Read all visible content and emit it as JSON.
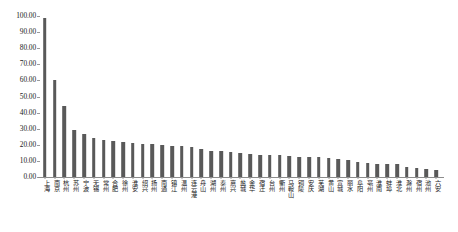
{
  "chart_data": {
    "type": "bar",
    "title": "",
    "subtitle": "",
    "xlabel": "",
    "ylabel": "",
    "ylim": [
      0,
      100
    ],
    "grid": false,
    "legend": "none",
    "bar_color": "#595959",
    "axis_color": "#8c8c8c",
    "y_ticks": [
      "0.00",
      "10.00",
      "20.00",
      "30.00",
      "40.00",
      "50.00",
      "60.00",
      "70.00",
      "80.00",
      "90.00",
      "100.00"
    ],
    "y_tick_values": [
      0,
      10,
      20,
      30,
      40,
      50,
      60,
      70,
      80,
      90,
      100
    ],
    "categories": [
      "上海",
      "南京",
      "杭州",
      "苏州",
      "宁波",
      "无锡",
      "常州",
      "合肥",
      "徐州",
      "淮安",
      "绍兴",
      "扬州",
      "南通",
      "镇江",
      "温州",
      "连云港",
      "舟山",
      "湖州",
      "泰州",
      "嘉兴",
      "盐城",
      "金华",
      "宿迁",
      "台州",
      "衢州",
      "马鞍山",
      "铜陵",
      "安庆",
      "芜湖",
      "黄山",
      "宣城",
      "丽水",
      "阜阳",
      "亳州",
      "淮南",
      "蚌埠",
      "淮北",
      "滁州",
      "宿州",
      "池州",
      "六安"
    ],
    "values": [
      98.8,
      60.3,
      43.8,
      28.9,
      26.6,
      24.1,
      22.9,
      22.6,
      22.0,
      21.0,
      20.7,
      20.5,
      20.1,
      19.4,
      19.3,
      18.9,
      17.6,
      16.1,
      16.1,
      15.7,
      14.9,
      14.2,
      13.8,
      13.6,
      13.4,
      12.9,
      12.7,
      12.3,
      12.2,
      11.8,
      11.3,
      10.4,
      9.3,
      8.8,
      8.3,
      8.1,
      7.9,
      6.0,
      5.4,
      4.8,
      4.4
    ]
  }
}
